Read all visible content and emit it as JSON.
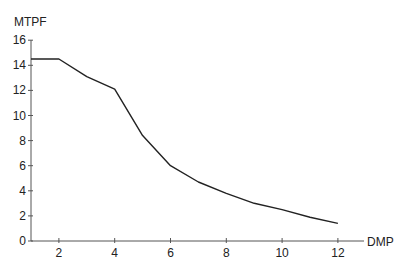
{
  "chart_data": {
    "type": "line",
    "title": "",
    "xlabel": "DMP",
    "ylabel": "MTPF",
    "xlim": [
      1,
      13.5
    ],
    "ylim": [
      0,
      16
    ],
    "grid": false,
    "legend": null,
    "x_ticks": [
      2,
      4,
      6,
      8,
      10,
      12
    ],
    "y_ticks": [
      0,
      2,
      4,
      6,
      8,
      10,
      12,
      14,
      16
    ],
    "series": [
      {
        "name": "MTPF",
        "color": "#222222",
        "x": [
          1,
          2,
          3,
          4,
          5,
          6,
          7,
          8,
          9,
          10,
          11,
          12
        ],
        "values": [
          14.5,
          14.5,
          13.1,
          12.1,
          8.4,
          6.0,
          4.7,
          3.8,
          3.0,
          2.5,
          1.9,
          1.4
        ]
      }
    ]
  }
}
